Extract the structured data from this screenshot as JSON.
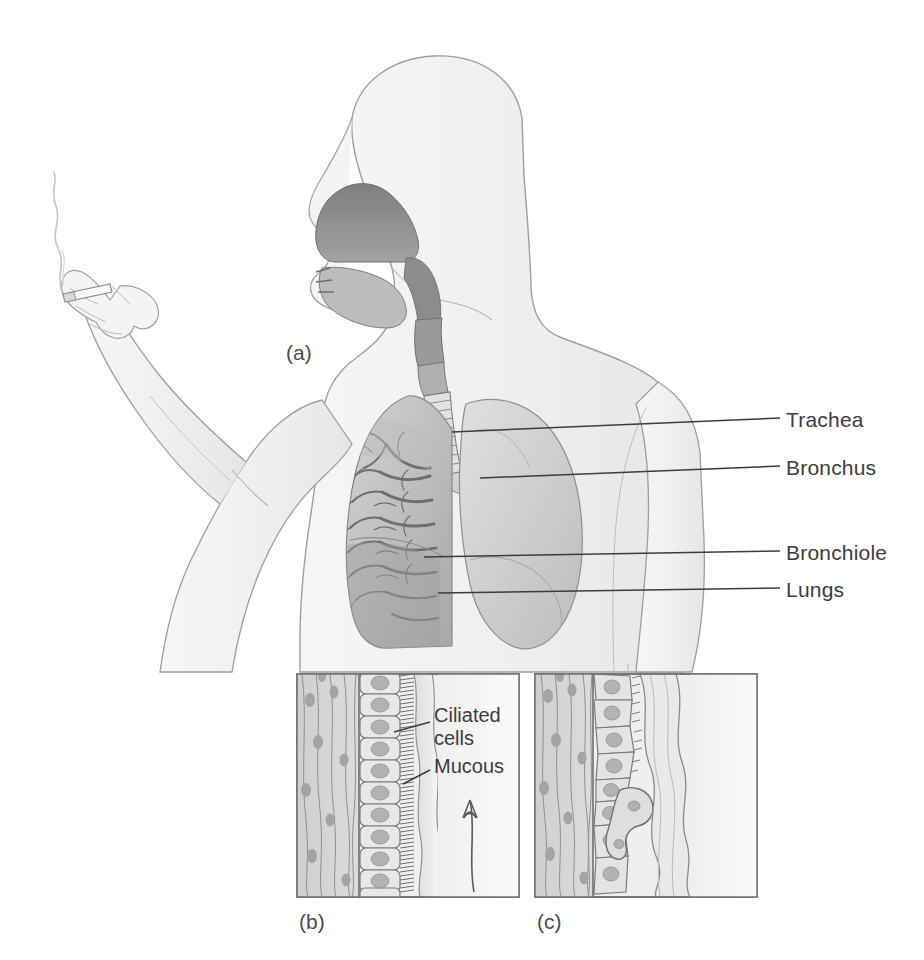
{
  "figure": {
    "background_color": "#ffffff",
    "ink_color": "#3c3c3c",
    "body_fill_color": "#f1f1f1",
    "body_outline_color": "#9a9a9a",
    "airway_fill_color": "#8d8d8d",
    "lung_fill_color": "#c9c9c9",
    "tissue_fill_color": "#d6d6d6"
  },
  "panels": [
    {
      "id": "a",
      "caption": "(a)",
      "x": 286,
      "y": 341
    },
    {
      "id": "b",
      "caption": "(b)",
      "x": 299,
      "y": 910
    },
    {
      "id": "c",
      "caption": "(c)",
      "x": 537,
      "y": 910
    }
  ],
  "callouts": [
    {
      "id": "trachea",
      "label": "Trachea",
      "label_x": 786,
      "label_y": 408,
      "line_from_x": 452,
      "line_from_y": 432,
      "line_to_x": 780,
      "line_to_y": 418
    },
    {
      "id": "bronchus",
      "label": "Bronchus",
      "label_x": 786,
      "label_y": 456,
      "line_from_x": 480,
      "line_from_y": 478,
      "line_to_x": 780,
      "line_to_y": 466
    },
    {
      "id": "bronchiole",
      "label": "Bronchiole",
      "label_x": 786,
      "label_y": 541,
      "line_from_x": 424,
      "line_from_y": 557,
      "line_to_x": 780,
      "line_to_y": 551
    },
    {
      "id": "lungs",
      "label": "Lungs",
      "label_x": 786,
      "label_y": 578,
      "line_from_x": 438,
      "line_from_y": 593,
      "line_to_x": 780,
      "line_to_y": 588
    }
  ],
  "inset_labels": [
    {
      "id": "ciliated-cells",
      "line1": "Ciliated",
      "line2": "cells",
      "label_x": 434,
      "label_y": 714,
      "leader_from_x": 394,
      "leader_from_y": 732,
      "leader_to_x": 430,
      "leader_to_y": 722
    },
    {
      "id": "mucous",
      "line1": "Mucous",
      "line2": "",
      "label_x": 434,
      "label_y": 762,
      "leader_from_x": 403,
      "leader_from_y": 784,
      "leader_to_x": 430,
      "leader_to_y": 770
    }
  ],
  "inset_panels": {
    "b": {
      "id": "b",
      "x": 297,
      "y": 674,
      "width": 222,
      "height": 223,
      "description": "Healthy ciliated pseudostratified epithelium with intact cilia and a thin mucous layer swept upward",
      "has_clearance_arrow": true,
      "arrow_direction": "up",
      "cell_count": 11
    },
    "c": {
      "id": "c",
      "x": 535,
      "y": 674,
      "width": 222,
      "height": 223,
      "description": "Smoke-damaged epithelium with flattened cells, lost cilia and thickened stagnant mucous",
      "has_clearance_arrow": false,
      "arrow_direction": "",
      "cell_count": 8
    }
  },
  "smoker": {
    "cigarette": "cigarette",
    "smoke": "smoke-trail",
    "hand": "hand-holding-cigarette",
    "pose": "left arm raised, cigarette held between fingers"
  },
  "anatomy_parts": [
    "nasal-cavity",
    "oral-cavity",
    "tongue",
    "pharynx",
    "larynx",
    "trachea",
    "bronchus",
    "bronchiole",
    "left-lung",
    "right-lung"
  ]
}
